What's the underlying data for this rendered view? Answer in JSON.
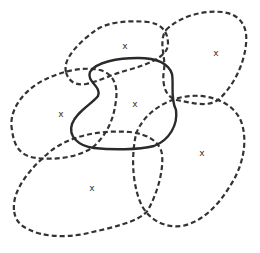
{
  "diagram": {
    "stroke_color": "#333333",
    "background": "#ffffff",
    "regions": [
      {
        "id": "central",
        "style": "solid",
        "marker": "x",
        "marker_pos": [
          135,
          104
        ]
      },
      {
        "id": "top",
        "style": "dashed",
        "marker": "x",
        "marker_pos": [
          125,
          46
        ]
      },
      {
        "id": "top-right",
        "style": "dashed",
        "marker": "x",
        "marker_pos": [
          216,
          53
        ]
      },
      {
        "id": "left",
        "style": "dashed",
        "marker": "x",
        "marker_pos": [
          61,
          114
        ]
      },
      {
        "id": "bottom-right",
        "style": "dashed",
        "marker": "x",
        "marker_pos": [
          202,
          153
        ]
      },
      {
        "id": "bottom-left",
        "style": "dashed",
        "marker": "x",
        "marker_pos": [
          92,
          188
        ]
      }
    ]
  }
}
